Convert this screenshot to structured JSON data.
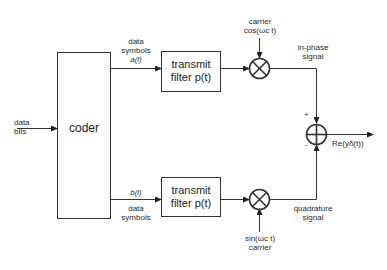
{
  "diagram": {
    "type": "block-diagram",
    "title": "",
    "input": {
      "label_line1": "data",
      "label_line2": "bits"
    },
    "coder": {
      "label": "coder"
    },
    "top_branch": {
      "symbols_line1": "data",
      "symbols_line2": "symbols",
      "symbol_var": "a(l)",
      "filter_line1": "transmit",
      "filter_line2": "filter p(t)",
      "carrier_line1": "carrier",
      "carrier_line2": "cos(ωc t)",
      "multiplier": "⊗",
      "signal_line1": "in-phase",
      "signal_line2": "signal",
      "sign": "+"
    },
    "bottom_branch": {
      "symbol_var": "b(l)",
      "symbols_line1": "data",
      "symbols_line2": "symbols",
      "filter_line1": "transmit",
      "filter_line2": "filter p(t)",
      "carrier_line1": "sin(ωc t)",
      "carrier_line2": "carrier",
      "multiplier": "⊗",
      "signal_line1": "quadrature",
      "signal_line2": "signal",
      "sign": "-"
    },
    "summer": {
      "symbol": "⊕"
    },
    "output": {
      "label": "Re(yδ(t))"
    }
  }
}
